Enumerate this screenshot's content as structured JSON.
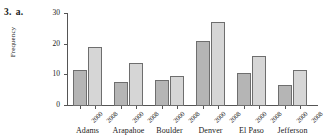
{
  "problem": {
    "number": "3.",
    "part": "a."
  },
  "chart_data": {
    "type": "bar",
    "title": "",
    "xlabel": "",
    "ylabel": "Frequency",
    "ylim": [
      0,
      30
    ],
    "yticks": [
      0,
      10,
      20,
      30
    ],
    "ytick_labels": [
      "0",
      "10",
      "20",
      "30"
    ],
    "grid": false,
    "legend": "none",
    "categories": [
      "Adams",
      "Arapahoe",
      "Boulder",
      "Denver",
      "El Paso",
      "Jefferson"
    ],
    "subcategories": [
      "2000",
      "2008"
    ],
    "series": [
      {
        "name": "2000",
        "color": "#b5b5b5",
        "values": [
          11.5,
          7.5,
          8.1,
          21.0,
          10.5,
          6.5
        ]
      },
      {
        "name": "2008",
        "color": "#d6d6d6",
        "values": [
          18.8,
          13.8,
          9.4,
          27.2,
          16.0,
          11.4
        ]
      }
    ]
  },
  "colors": {
    "bar_2000": "#b5b5b5",
    "bar_2008": "#d6d6d6",
    "bar_edge": "#6e6e6e",
    "axis": "#555555",
    "background": "#ffffff"
  }
}
